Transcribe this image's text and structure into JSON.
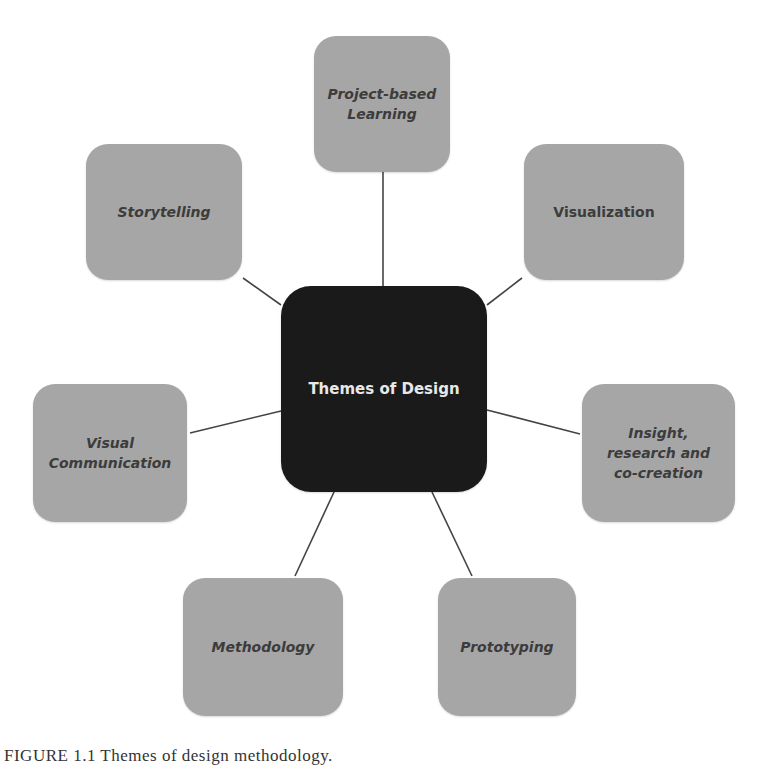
{
  "diagram": {
    "center": {
      "label": "Themes of Design",
      "color": "#1a1a1a"
    },
    "node_color": "#a6a6a6",
    "nodes": [
      {
        "id": "project-based-learning",
        "label": "Project-based Learning"
      },
      {
        "id": "visualization",
        "label": "Visualization"
      },
      {
        "id": "insight-research-co-creation",
        "label": "Insight, research and co-creation"
      },
      {
        "id": "prototyping",
        "label": "Prototyping"
      },
      {
        "id": "methodology",
        "label": "Methodology"
      },
      {
        "id": "visual-communication",
        "label": "Visual Communication"
      },
      {
        "id": "storytelling",
        "label": "Storytelling"
      }
    ],
    "caption": "FIGURE 1.1  Themes of design methodology."
  }
}
